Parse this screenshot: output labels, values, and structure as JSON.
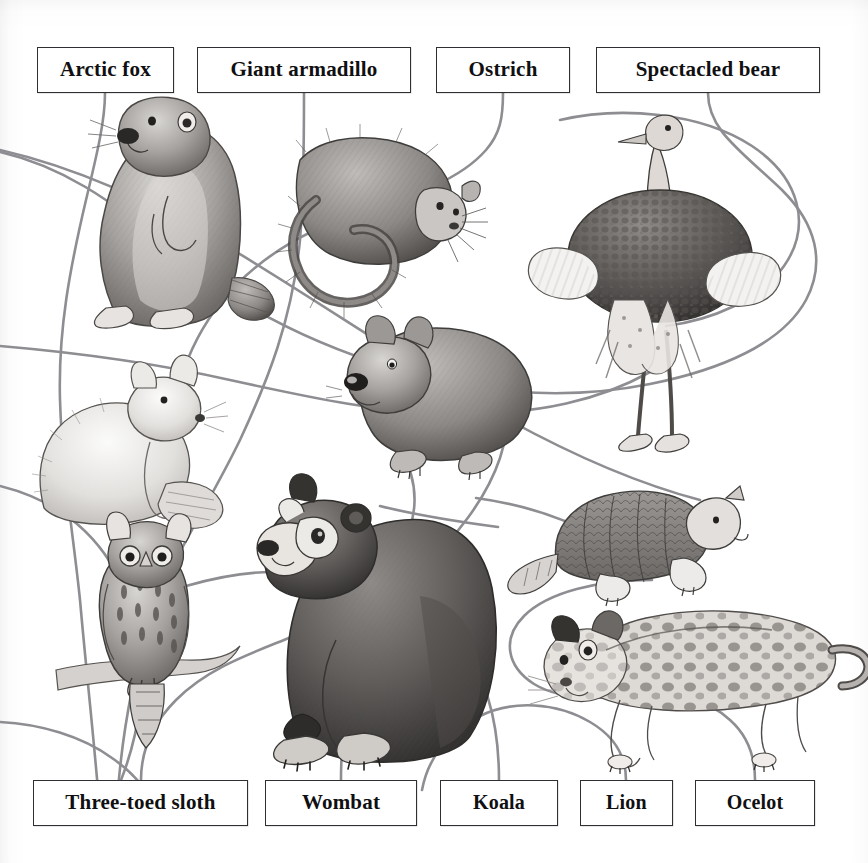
{
  "page": {
    "kind": "matching-puzzle",
    "background_color": "#ffffff",
    "ink_color": "#101012",
    "connector_color": "#8b8b8f"
  },
  "labels": [
    {
      "id": "arctic-fox",
      "text": "Arctic fox",
      "x": 37,
      "y": 47,
      "w": 137,
      "h": 46,
      "row": "top"
    },
    {
      "id": "giant-armadillo",
      "text": "Giant armadillo",
      "x": 197,
      "y": 47,
      "w": 214,
      "h": 46,
      "row": "top"
    },
    {
      "id": "ostrich",
      "text": "Ostrich",
      "x": 436,
      "y": 47,
      "w": 134,
      "h": 46,
      "row": "top"
    },
    {
      "id": "spectacled-bear",
      "text": "Spectacled bear",
      "x": 596,
      "y": 47,
      "w": 224,
      "h": 46,
      "row": "top"
    },
    {
      "id": "three-toed-sloth",
      "text": "Three-toed sloth",
      "x": 33,
      "y": 780,
      "w": 215,
      "h": 46,
      "row": "bottom"
    },
    {
      "id": "wombat",
      "text": "Wombat",
      "x": 265,
      "y": 780,
      "w": 152,
      "h": 46,
      "row": "bottom"
    },
    {
      "id": "koala",
      "text": "Koala",
      "x": 440,
      "y": 780,
      "w": 118,
      "h": 46,
      "row": "bottom"
    },
    {
      "id": "lion",
      "text": "Lion",
      "x": 580,
      "y": 780,
      "w": 93,
      "h": 46,
      "row": "bottom"
    },
    {
      "id": "ocelot",
      "text": "Ocelot",
      "x": 695,
      "y": 780,
      "w": 120,
      "h": 46,
      "row": "bottom"
    }
  ],
  "illustrations": [
    {
      "id": "marmot-standing",
      "name": "standing-marmot-illustration",
      "x": 62,
      "y": 108,
      "w": 200,
      "h": 215
    },
    {
      "id": "sloth-curled",
      "name": "three-toed-sloth-illustration",
      "x": 255,
      "y": 132,
      "w": 225,
      "h": 195
    },
    {
      "id": "ostrich",
      "name": "ostrich-illustration",
      "x": 565,
      "y": 118,
      "w": 215,
      "h": 340
    },
    {
      "id": "arctic-fox",
      "name": "arctic-fox-illustration",
      "x": 28,
      "y": 352,
      "w": 205,
      "h": 175
    },
    {
      "id": "wombat",
      "name": "wombat-illustration",
      "x": 340,
      "y": 318,
      "w": 200,
      "h": 160
    },
    {
      "id": "giant-armadillo",
      "name": "giant-armadillo-illustration",
      "x": 505,
      "y": 487,
      "w": 240,
      "h": 120
    },
    {
      "id": "owl",
      "name": "horned-owl-illustration",
      "x": 50,
      "y": 548,
      "w": 185,
      "h": 205
    },
    {
      "id": "spectacled-bear",
      "name": "spectacled-bear-illustration",
      "x": 256,
      "y": 490,
      "w": 240,
      "h": 270
    },
    {
      "id": "ocelot",
      "name": "ocelot-illustration",
      "x": 525,
      "y": 608,
      "w": 310,
      "h": 150
    }
  ],
  "connectors": [
    {
      "id": "c1",
      "from": "arctic-fox",
      "to": "curve-down-left"
    },
    {
      "id": "c2",
      "from": "giant-armadillo",
      "to": "curve-down-center"
    },
    {
      "id": "c3",
      "from": "ostrich",
      "to": "curve-sweep-right"
    },
    {
      "id": "c4",
      "from": "spectacled-bear",
      "to": "curve-long-left"
    },
    {
      "id": "c5",
      "from": "three-toed-sloth",
      "to": "curve-up-right"
    },
    {
      "id": "c6",
      "from": "wombat",
      "to": "curve-up-center"
    },
    {
      "id": "c7",
      "from": "koala",
      "to": "curve-up-left"
    },
    {
      "id": "c8",
      "from": "lion",
      "to": "curve-off-left"
    },
    {
      "id": "c9",
      "from": "ocelot",
      "to": "curve-up-to-ocelot"
    }
  ]
}
